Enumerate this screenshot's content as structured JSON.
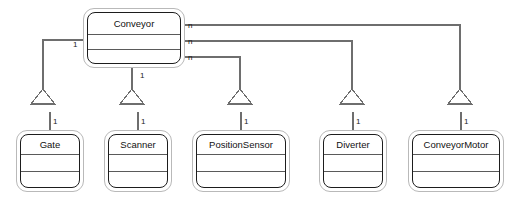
{
  "diagram": {
    "type": "uml-class-diagram",
    "background_color": "#ffffff",
    "line_color": "#6e6e6e",
    "border_color": "#1d1d1d",
    "outer_frame_color": "#b9b9b9"
  },
  "classes": [
    {
      "id": "conveyor",
      "name": "Conveyor",
      "x": 83,
      "y": 8,
      "width": 102,
      "height": 60
    },
    {
      "id": "gate",
      "name": "Gate",
      "x": 16,
      "y": 130,
      "width": 68,
      "height": 62
    },
    {
      "id": "scanner",
      "name": "Scanner",
      "x": 104,
      "y": 130,
      "width": 68,
      "height": 62
    },
    {
      "id": "positionsensor",
      "name": "PositionSensor",
      "x": 192,
      "y": 130,
      "width": 98,
      "height": 62
    },
    {
      "id": "diverter",
      "name": "Diverter",
      "x": 319,
      "y": 130,
      "width": 68,
      "height": 62
    },
    {
      "id": "conveyormotor",
      "name": "ConveyorMotor",
      "x": 408,
      "y": 130,
      "width": 96,
      "height": 62
    }
  ],
  "multiplicities": [
    {
      "id": "conveyor-left-gate",
      "label": "1",
      "x": 73,
      "y": 41,
      "owner": "conveyor",
      "side": "left"
    },
    {
      "id": "conveyor-bottom-scanner",
      "label": "1",
      "x": 140,
      "y": 72,
      "owner": "conveyor",
      "side": "bottom"
    },
    {
      "id": "conveyor-right-1",
      "label": "n",
      "x": 188,
      "y": 22,
      "owner": "conveyor",
      "side": "right"
    },
    {
      "id": "conveyor-right-2",
      "label": "n",
      "x": 188,
      "y": 38,
      "owner": "conveyor",
      "side": "right"
    },
    {
      "id": "conveyor-right-3",
      "label": "n",
      "x": 188,
      "y": 54,
      "owner": "conveyor",
      "side": "right"
    },
    {
      "id": "gate-end",
      "label": "1",
      "x": 51,
      "y": 118,
      "owner": "gate",
      "side": "top"
    },
    {
      "id": "scanner-end",
      "label": "1",
      "x": 140,
      "y": 118,
      "owner": "scanner",
      "side": "top"
    },
    {
      "id": "positionsensor-end",
      "label": "1",
      "x": 243,
      "y": 118,
      "owner": "positionsensor",
      "side": "top"
    },
    {
      "id": "diverter-end",
      "label": "1",
      "x": 355,
      "y": 118,
      "owner": "diverter",
      "side": "top"
    },
    {
      "id": "conveyormotor-end",
      "label": "1",
      "x": 463,
      "y": 118,
      "owner": "conveyormotor",
      "side": "top"
    }
  ],
  "associations": [
    {
      "id": "conveyor-gate",
      "from": "conveyor",
      "to": "gate",
      "from_multiplicity": "1",
      "to_multiplicity": "1",
      "arrowhead": "hollow-triangle"
    },
    {
      "id": "conveyor-scanner",
      "from": "conveyor",
      "to": "scanner",
      "from_multiplicity": "1",
      "to_multiplicity": "1",
      "arrowhead": "hollow-triangle"
    },
    {
      "id": "conveyor-positionsensor",
      "from": "conveyor",
      "to": "positionsensor",
      "from_multiplicity": "n",
      "to_multiplicity": "1",
      "arrowhead": "hollow-triangle"
    },
    {
      "id": "conveyor-diverter",
      "from": "conveyor",
      "to": "diverter",
      "from_multiplicity": "n",
      "to_multiplicity": "1",
      "arrowhead": "hollow-triangle"
    },
    {
      "id": "conveyor-conveyormotor",
      "from": "conveyor",
      "to": "conveyormotor",
      "from_multiplicity": "n",
      "to_multiplicity": "1",
      "arrowhead": "hollow-triangle"
    }
  ]
}
